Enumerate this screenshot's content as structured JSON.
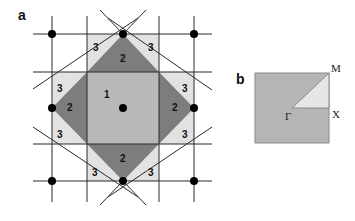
{
  "panels": {
    "a": {
      "label": "a",
      "zone_labels": {
        "zone1": "1",
        "zone2": [
          "2",
          "2",
          "2",
          "2"
        ],
        "zone3": [
          "3",
          "3",
          "3",
          "3",
          "3",
          "3",
          "3",
          "3"
        ]
      }
    },
    "b": {
      "label": "b",
      "points": {
        "gamma": "Γ",
        "m": "M",
        "x": "X"
      }
    }
  },
  "colors": {
    "zone1": "#b9b9b9",
    "zone2": "#7d7d7d",
    "zone3": "#e2e2e2",
    "grid_line": "#2a2a2a",
    "dot": "#000000",
    "ibz_fill": "#b5b5b5",
    "ibz_wedge": "#e6e6e6"
  }
}
